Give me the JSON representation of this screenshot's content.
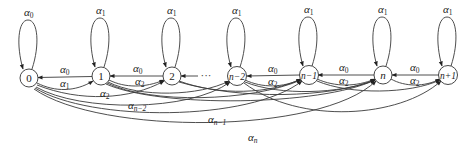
{
  "diagram": {
    "type": "state-transition-graph",
    "nodes": [
      {
        "id": "0",
        "label": "0",
        "x": 29,
        "y": 78
      },
      {
        "id": "1",
        "label": "1",
        "x": 101,
        "y": 76
      },
      {
        "id": "2",
        "label": "2",
        "x": 172,
        "y": 76
      },
      {
        "id": "n-2",
        "label": "n−2",
        "x": 237,
        "y": 76
      },
      {
        "id": "n-1",
        "label": "n−1",
        "x": 309,
        "y": 75
      },
      {
        "id": "n",
        "label": "n",
        "x": 383,
        "y": 75
      },
      {
        "id": "n+1",
        "label": "n+1",
        "x": 448,
        "y": 75
      }
    ],
    "ellipsis": "···",
    "self_loops": [
      {
        "node": "0",
        "label": "α",
        "sub": "0"
      },
      {
        "node": "1",
        "label": "α",
        "sub": "1"
      },
      {
        "node": "2",
        "label": "α",
        "sub": "1"
      },
      {
        "node": "n-2",
        "label": "α",
        "sub": "1"
      },
      {
        "node": "n-1",
        "label": "α",
        "sub": "1"
      },
      {
        "node": "n",
        "label": "α",
        "sub": "1"
      },
      {
        "node": "n+1",
        "label": "α",
        "sub": "1"
      }
    ],
    "edges": [
      {
        "from": "1",
        "to": "0",
        "label": "α",
        "sub": "0"
      },
      {
        "from": "0",
        "to": "1",
        "label": "α",
        "sub": "1"
      },
      {
        "from": "2",
        "to": "1",
        "label": "α",
        "sub": "0"
      },
      {
        "from": "1",
        "to": "2",
        "label": "α",
        "sub": "2"
      },
      {
        "from": "0",
        "to": "2",
        "label": "α",
        "sub": "2"
      },
      {
        "from": "n-1",
        "to": "n-2",
        "label": "α",
        "sub": "0"
      },
      {
        "from": "n-2",
        "to": "n-1",
        "label": "α",
        "sub": "2"
      },
      {
        "from": "n",
        "to": "n-1",
        "label": "α",
        "sub": "0"
      },
      {
        "from": "n-1",
        "to": "n",
        "label": "α",
        "sub": "2"
      },
      {
        "from": "n+1",
        "to": "n",
        "label": "α",
        "sub": "0"
      },
      {
        "from": "n",
        "to": "n+1",
        "label": "α",
        "sub": "2"
      },
      {
        "from": "0",
        "to": "n-2",
        "label": "α",
        "sub": "n−2"
      },
      {
        "from": "0",
        "to": "n-1",
        "label": "α",
        "sub": "n−1"
      },
      {
        "from": "0",
        "to": "n",
        "label": "α",
        "sub": "n"
      }
    ],
    "labels": {
      "alpha": "α",
      "sub_0": "0",
      "sub_1": "1",
      "sub_2": "2",
      "sub_n_minus_2": "n−2",
      "sub_n_minus_1": "n−1",
      "sub_n": "n",
      "node_0": "0",
      "node_1": "1",
      "node_2": "2",
      "node_n_minus_2": "n−2",
      "node_n_minus_1": "n−1",
      "node_n": "n",
      "node_n_plus_1": "n+1",
      "ellipsis": "···"
    },
    "colors": {
      "stroke": "#333333",
      "background": "#ffffff"
    }
  }
}
